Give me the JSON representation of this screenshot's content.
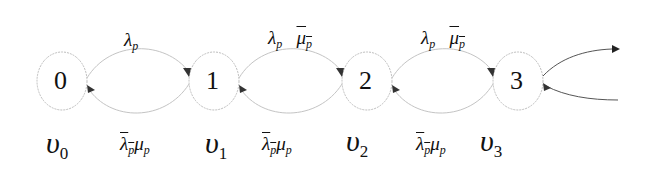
{
  "diagram": {
    "type": "state-transition",
    "nodes": [
      {
        "id": "0",
        "label": "0",
        "state_label": "υ",
        "state_sub": "0"
      },
      {
        "id": "1",
        "label": "1",
        "state_label": "υ",
        "state_sub": "1"
      },
      {
        "id": "2",
        "label": "2",
        "state_label": "υ",
        "state_sub": "2"
      },
      {
        "id": "3",
        "label": "3",
        "state_label": "υ",
        "state_sub": "3"
      }
    ],
    "edges_forward": [
      {
        "from": "0",
        "to": "1",
        "label": [
          {
            "sym": "λ",
            "sub": "p",
            "overline": false
          }
        ]
      },
      {
        "from": "1",
        "to": "2",
        "label": [
          {
            "sym": "λ",
            "sub": "p",
            "overline": false
          },
          {
            "sym": "μ",
            "sub": "p",
            "overline": true
          }
        ]
      },
      {
        "from": "2",
        "to": "3",
        "label": [
          {
            "sym": "λ",
            "sub": "p",
            "overline": false
          },
          {
            "sym": "μ",
            "sub": "p",
            "overline": true
          }
        ]
      }
    ],
    "edges_backward": [
      {
        "from": "1",
        "to": "0",
        "label": [
          {
            "sym": "λ",
            "sub": "p",
            "overline": true
          },
          {
            "sym": "μ",
            "sub": "p",
            "overline": false
          }
        ]
      },
      {
        "from": "2",
        "to": "1",
        "label": [
          {
            "sym": "λ",
            "sub": "p",
            "overline": true
          },
          {
            "sym": "μ",
            "sub": "p",
            "overline": false
          }
        ]
      },
      {
        "from": "3",
        "to": "2",
        "label": [
          {
            "sym": "λ",
            "sub": "p",
            "overline": true
          },
          {
            "sym": "μ",
            "sub": "p",
            "overline": false
          }
        ]
      }
    ],
    "continuation": "arrows to the right of node 3 (outgoing forward, incoming backward)"
  },
  "labels": {
    "n0": "0",
    "n1": "1",
    "n2": "2",
    "n3": "3",
    "lambda": "λ",
    "mu": "μ",
    "p": "p",
    "upsilon": "υ",
    "s0": "0",
    "s1": "1",
    "s2": "2",
    "s3": "3"
  },
  "colors": {
    "node_stroke": "#bdbdbd",
    "edge_stroke": "#c4c4c4",
    "arrow": "#333333",
    "text": "#111111"
  }
}
